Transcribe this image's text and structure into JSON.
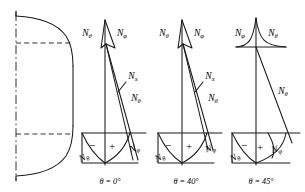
{
  "figure": {
    "title": "",
    "vessel": {
      "name": "pressure-vessel-head-outline",
      "features": [
        "centerline",
        "tangent-line-upper",
        "tangent-line-lower",
        "torispherical-head-profile",
        "cylindrical-shell-wall"
      ]
    },
    "panels": [
      {
        "id": "panel-0",
        "caption": "θ = 0°",
        "theta_deg": 0,
        "labels": {
          "top_left": {
            "base": "N",
            "sub": "θ"
          },
          "top_right": {
            "base": "N",
            "sub": "φ"
          },
          "mid_upper": {
            "base": "N",
            "sub": "x"
          },
          "mid_lower": {
            "base": "N",
            "sub": "θ"
          },
          "bottom_left": {
            "base": "N",
            "sub": "θ"
          },
          "bottom_right": {
            "base": "N",
            "sub": "φ"
          }
        },
        "signs": {
          "negative": "−",
          "positive": "+"
        }
      },
      {
        "id": "panel-1",
        "caption": "θ = 40°",
        "theta_deg": 40,
        "labels": {
          "top_left": {
            "base": "N",
            "sub": "θ"
          },
          "top_right": {
            "base": "N",
            "sub": "φ"
          },
          "mid_upper": {
            "base": "N",
            "sub": "x"
          },
          "mid_lower": {
            "base": "N",
            "sub": "θ"
          },
          "bottom_left": {
            "base": "N",
            "sub": "θ"
          },
          "bottom_right": {
            "base": "N",
            "sub": "φ"
          }
        },
        "signs": {
          "negative": "−",
          "positive": "+"
        }
      },
      {
        "id": "panel-2",
        "caption": "θ = 45°",
        "theta_deg": 45,
        "labels": {
          "top_left": {
            "base": "N",
            "sub": "φ"
          },
          "top_right": {
            "base": "N",
            "sub": "θ"
          },
          "mid_lower": {
            "base": "N",
            "sub": "θ"
          },
          "bottom_left": {
            "base": "N",
            "sub": "θ"
          },
          "bottom_right": {
            "base": "N",
            "sub": "φ"
          }
        },
        "signs": {
          "negative": "−",
          "positive": "+"
        }
      }
    ],
    "colors": {
      "ink": "#1a1a1a",
      "background": "#ffffff"
    }
  }
}
